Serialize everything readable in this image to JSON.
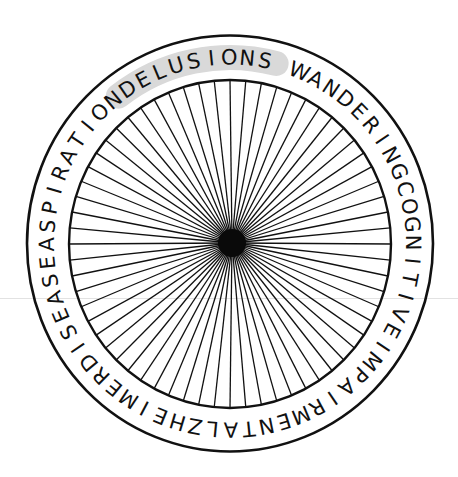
{
  "figure": {
    "type": "radial word wheel",
    "ring_text": "DELUSIONS WANDERINGCOGNITIVEIMPAIRMENTALZHEIMERDISEASEASPIRATION",
    "words": [
      "DELUSIONS",
      "WANDERING",
      "COGNITIVE",
      "IMPAIRMENT",
      "ALZHEIMER",
      "DISEASE",
      "ASPIRATION"
    ],
    "highlighted_word": "DELUSIONS",
    "spoke_count": 64,
    "colors": {
      "stroke": "#111111",
      "highlight": "#d9d9d9",
      "background": "#ffffff"
    }
  }
}
